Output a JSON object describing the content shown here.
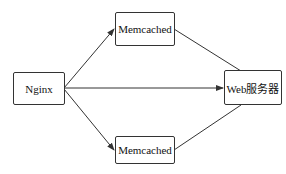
{
  "diagram": {
    "type": "architecture",
    "nodes": [
      {
        "id": "nginx",
        "label": "Nginx"
      },
      {
        "id": "memcached_top",
        "label": "Memcached"
      },
      {
        "id": "memcached_bottom",
        "label": "Memcached"
      },
      {
        "id": "web_server",
        "label": "Web服务器"
      }
    ],
    "edges": [
      {
        "from": "nginx",
        "to": "memcached_top",
        "arrow": true
      },
      {
        "from": "nginx",
        "to": "memcached_bottom",
        "arrow": true
      },
      {
        "from": "nginx",
        "to": "web_server",
        "arrow": true
      },
      {
        "from": "memcached_top",
        "to": "web_server",
        "arrow": false
      },
      {
        "from": "memcached_bottom",
        "to": "web_server",
        "arrow": false
      }
    ],
    "colors": {
      "line": "#333333",
      "background": "#ffffff"
    }
  }
}
